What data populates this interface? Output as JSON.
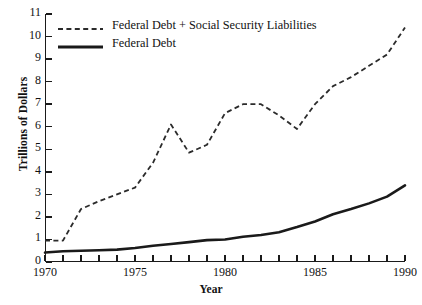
{
  "chart_data": {
    "type": "line",
    "title": "",
    "xlabel": "Year",
    "ylabel": "Trillions of Dollars",
    "xlim": [
      1970,
      1990
    ],
    "ylim": [
      0,
      11
    ],
    "grid": false,
    "legend_position": "upper left (inside axes)",
    "x": [
      1970,
      1971,
      1972,
      1973,
      1974,
      1975,
      1976,
      1977,
      1978,
      1979,
      1980,
      1981,
      1982,
      1983,
      1984,
      1985,
      1986,
      1987,
      1988,
      1989,
      1990
    ],
    "xticks_major": [
      1970,
      1975,
      1980,
      1985,
      1990
    ],
    "xticks_major_labels": [
      "1970",
      "1975",
      "1980",
      "1985",
      "1990"
    ],
    "xticks_minor_every": 1,
    "yticks": [
      0,
      1,
      2,
      3,
      4,
      5,
      6,
      7,
      8,
      9,
      10,
      11
    ],
    "ytick_labels": [
      "0",
      "1",
      "2",
      "3",
      "4",
      "5",
      "6",
      "7",
      "8",
      "9",
      "10",
      "11"
    ],
    "series": [
      {
        "name": "Federal Debt + Social Security Liabilities",
        "style": "dashed",
        "color": "#2b2b2b",
        "values": [
          0.95,
          0.95,
          2.35,
          2.7,
          3.0,
          3.3,
          4.4,
          6.1,
          4.85,
          5.2,
          6.6,
          7.0,
          7.0,
          6.5,
          5.9,
          7.0,
          7.8,
          8.2,
          8.7,
          9.2,
          10.4
        ]
      },
      {
        "name": "Federal Debt",
        "style": "solid",
        "color": "#1a1a1a",
        "values": [
          0.42,
          0.48,
          0.5,
          0.52,
          0.55,
          0.62,
          0.72,
          0.8,
          0.88,
          0.97,
          1.0,
          1.12,
          1.2,
          1.32,
          1.55,
          1.8,
          2.12,
          2.35,
          2.6,
          2.9,
          3.4
        ]
      }
    ]
  },
  "legend": {
    "items": [
      {
        "label": "Federal Debt + Social Security Liabilities",
        "style": "dashed"
      },
      {
        "label": "Federal Debt",
        "style": "solid"
      }
    ]
  },
  "axes": {
    "ylabel": "Trillions of Dollars",
    "xlabel": "Year"
  }
}
